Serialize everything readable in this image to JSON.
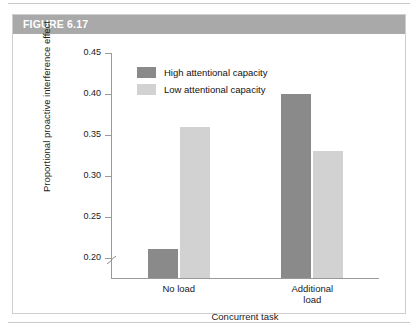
{
  "figure": {
    "header_label": "FIGURE 6.17",
    "header_bg": "#a9a9a9",
    "frame_border": "#cfcfcf"
  },
  "legend": {
    "position": "top-left-inside",
    "entries": [
      {
        "label": "High attentional capacity",
        "color": "#8a8a8a"
      },
      {
        "label": "Low attentional capacity",
        "color": "#d2d2d2"
      }
    ]
  },
  "chart_data": {
    "type": "bar",
    "title": "FIGURE 6.17",
    "categories": [
      "No load",
      "Additional load"
    ],
    "series": [
      {
        "name": "High attentional capacity",
        "color": "#8a8a8a",
        "values": [
          0.21,
          0.4
        ]
      },
      {
        "name": "Low attentional capacity",
        "color": "#d2d2d2",
        "values": [
          0.36,
          0.33
        ]
      }
    ],
    "xlabel": "Concurrent task",
    "ylabel": "Proportional proactive interference effect",
    "ylim": [
      0.175,
      0.45
    ],
    "ytick_labels": [
      "0.45",
      "0.40",
      "0.35",
      "0.30",
      "0.25",
      "0.20"
    ],
    "ytick_values": [
      0.45,
      0.4,
      0.35,
      0.3,
      0.25,
      0.2
    ],
    "axis_break": true,
    "axis_break_note": "y-axis broken below 0.20",
    "grid": false,
    "legend_position": "inside upper left"
  },
  "axis": {
    "x_category_labels": [
      "No load",
      "Additional load"
    ],
    "x_title": "Concurrent task",
    "y_title": "Proportional proactive interference effect"
  }
}
